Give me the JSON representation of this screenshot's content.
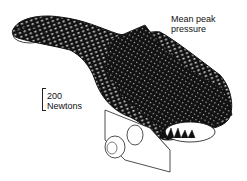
{
  "figure": {
    "annotation_title_line1": "Mean peak",
    "annotation_title_line2": "pressure",
    "scale_bar_value": "200",
    "scale_bar_unit": "Newtons",
    "colors": {
      "mesh": "#111111",
      "background": "#ffffff",
      "outline": "#222222"
    }
  }
}
